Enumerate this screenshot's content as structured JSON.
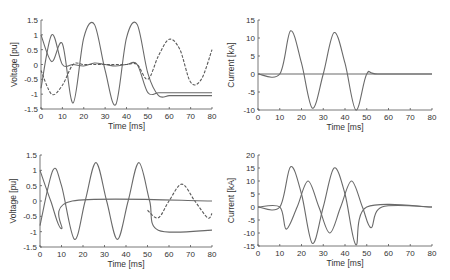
{
  "chart_data": [
    {
      "type": "line",
      "title": "",
      "xlabel": "Time [ms]",
      "ylabel": "Voltage [pu]",
      "xlim": [
        0,
        80
      ],
      "ylim": [
        -1.5,
        1.5
      ],
      "xticks": [
        0,
        10,
        20,
        30,
        40,
        50,
        60,
        70,
        80
      ],
      "yticks": [
        1.5,
        1,
        0.5,
        0,
        -0.5,
        -1,
        -1.5
      ],
      "ytick_labels": [
        "1.5",
        "1",
        "0.5",
        "0",
        "-0.5",
        "-1",
        "-1.5"
      ],
      "grid": false,
      "series": [
        {
          "name": "Phase A",
          "x": [
            0,
            5,
            10,
            15,
            20,
            25,
            30,
            35,
            40,
            45,
            50,
            55,
            60,
            65,
            70,
            75,
            80
          ],
          "values": [
            1,
            0.1,
            0.7,
            -1.3,
            0.9,
            1.35,
            -0.2,
            -1.35,
            0.9,
            1.35,
            -0.3,
            -1.05,
            -1.05,
            -1.05,
            -1.05,
            -1.05,
            -1.05
          ]
        },
        {
          "name": "Phase B",
          "x": [
            0,
            5,
            10,
            15,
            20,
            25,
            30,
            35,
            40,
            45,
            50,
            55,
            60,
            65,
            70,
            75,
            80
          ],
          "values": [
            -0.8,
            1,
            0,
            0,
            -0.05,
            0.05,
            0,
            -0.05,
            0,
            0,
            -0.95,
            -0.95,
            -0.95,
            -0.95,
            -0.95,
            -0.95,
            -0.95
          ]
        },
        {
          "name": "Phase C",
          "x": [
            0,
            5,
            10,
            15,
            20,
            25,
            30,
            35,
            40,
            45,
            50,
            55,
            60,
            65,
            70,
            75,
            80
          ],
          "values": [
            -0.2,
            -1,
            -0.7,
            0,
            0,
            0,
            0,
            0,
            0,
            0,
            -0.5,
            0.3,
            0.85,
            0.5,
            -0.6,
            -0.5,
            0.5
          ]
        }
      ]
    },
    {
      "type": "line",
      "title": "",
      "xlabel": "Time [ms]",
      "ylabel": "Current [kA]",
      "xlim": [
        0,
        80
      ],
      "ylim": [
        -10,
        15
      ],
      "xticks": [
        0,
        10,
        20,
        30,
        40,
        50,
        60,
        70,
        80
      ],
      "yticks": [
        15,
        10,
        5,
        0,
        -5,
        -10
      ],
      "grid": false,
      "series": [
        {
          "name": "Fault current",
          "x": [
            0,
            10,
            15,
            20,
            25,
            30,
            35,
            40,
            45,
            50,
            55,
            80
          ],
          "values": [
            0,
            0,
            12,
            3,
            -9.5,
            0,
            11.5,
            3,
            -10,
            0,
            0,
            0
          ]
        },
        {
          "name": "Other phases",
          "x": [
            0,
            10,
            20,
            30,
            40,
            50,
            80
          ],
          "values": [
            0,
            0,
            0,
            0,
            0,
            0,
            0
          ]
        }
      ]
    },
    {
      "type": "line",
      "title": "",
      "xlabel": "Time [ms]",
      "ylabel": "Voltage [pu]",
      "xlim": [
        0,
        80
      ],
      "ylim": [
        -1.5,
        1.5
      ],
      "xticks": [
        0,
        10,
        20,
        30,
        40,
        50,
        60,
        70,
        80
      ],
      "yticks": [
        1.5,
        1,
        0.5,
        0,
        -0.5,
        -1,
        -1.5
      ],
      "ytick_labels": [
        "1.5",
        "1",
        "0.5",
        "0",
        "-0.5",
        "-1",
        "-1.5"
      ],
      "grid": false,
      "series": [
        {
          "name": "Phase A",
          "x": [
            0,
            6,
            10,
            16,
            21,
            26,
            31,
            36,
            41,
            46,
            51,
            55,
            80
          ],
          "values": [
            -0.8,
            1,
            0.5,
            -1.25,
            0,
            1.25,
            0,
            -1.25,
            0,
            1.25,
            0,
            -0.95,
            -0.95
          ]
        },
        {
          "name": "Phase B",
          "x": [
            0,
            5,
            10,
            15,
            80
          ],
          "values": [
            1,
            0,
            -0.9,
            0,
            0
          ]
        },
        {
          "name": "Phase C",
          "x": [
            50,
            55,
            60,
            66,
            72,
            78,
            80
          ],
          "values": [
            -0.3,
            -0.55,
            0,
            0.55,
            0,
            -0.55,
            -0.4
          ]
        }
      ]
    },
    {
      "type": "line",
      "title": "",
      "xlabel": "Time [ms]",
      "ylabel": "Current [kA]",
      "xlim": [
        0,
        80
      ],
      "ylim": [
        -15,
        20
      ],
      "xticks": [
        0,
        10,
        20,
        30,
        40,
        50,
        60,
        70,
        80
      ],
      "yticks": [
        20,
        15,
        10,
        5,
        0,
        -5,
        -10,
        -15
      ],
      "grid": false,
      "series": [
        {
          "name": "Phase A current",
          "x": [
            0,
            10,
            15,
            20,
            25,
            30,
            35,
            40,
            45,
            50,
            80
          ],
          "values": [
            0,
            0,
            15.5,
            5,
            -14,
            0,
            15,
            5,
            -14.5,
            0,
            0
          ]
        },
        {
          "name": "Phase B current",
          "x": [
            0,
            10,
            13,
            18,
            23,
            28,
            33,
            38,
            43,
            48,
            52,
            57,
            80
          ],
          "values": [
            0,
            0,
            -8.5,
            0,
            10,
            0,
            -10,
            0,
            10,
            0,
            -8,
            0,
            0
          ]
        }
      ]
    }
  ]
}
